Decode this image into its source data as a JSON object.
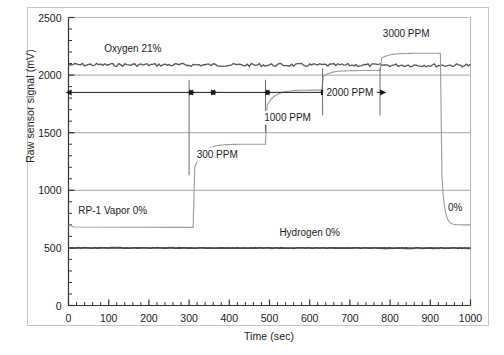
{
  "chart_data": {
    "type": "line",
    "title": "",
    "xlabel": "Time (sec)",
    "ylabel": "Raw sensor signal (mV)",
    "xlim": [
      0,
      1000
    ],
    "ylim": [
      0,
      2500
    ],
    "xticks": [
      0,
      100,
      200,
      300,
      400,
      500,
      600,
      700,
      800,
      900,
      1000
    ],
    "yticks": [
      0,
      500,
      1000,
      1500,
      2000,
      2500
    ],
    "x_minor_tick_step": 20,
    "y_minor_tick_step": 100,
    "grid": "horizontal-major",
    "legend": "none",
    "series": [
      {
        "name": "Oxygen 21%",
        "style": "noisy-flat",
        "color": "#555555",
        "points": [
          [
            0,
            2090
          ],
          [
            1000,
            2085
          ]
        ],
        "label": "Oxygen 21%",
        "label_x": 160,
        "label_y": 2200
      },
      {
        "name": "Hydrogen 0%",
        "style": "flat",
        "color": "#4a4a4a",
        "points": [
          [
            0,
            500
          ],
          [
            1000,
            498
          ]
        ],
        "label": "Hydrogen 0%",
        "label_x": 600,
        "label_y": 600
      },
      {
        "name": "RP-1 Vapor response",
        "style": "step-settling",
        "color": "#9a9a9a",
        "steps": [
          {
            "t_start": 0,
            "t_end": 310,
            "level": 700,
            "label": "RP-1 Vapor 0%"
          },
          {
            "t_start": 310,
            "t_end": 490,
            "level": 1400,
            "label": "300 PPM"
          },
          {
            "t_start": 490,
            "t_end": 630,
            "level": 1870,
            "label": "1000 PPM"
          },
          {
            "t_start": 630,
            "t_end": 775,
            "level": 2040,
            "label": "2000 PPM"
          },
          {
            "t_start": 775,
            "t_end": 925,
            "level": 2190,
            "label": "3000 PPM"
          },
          {
            "t_start": 925,
            "t_end": 1000,
            "level": 700,
            "label": "0%"
          }
        ]
      }
    ],
    "annotations": [
      {
        "text": "Oxygen 21%",
        "x": 160,
        "y": 2200
      },
      {
        "text": "RP-1 Vapor 0%",
        "x": 110,
        "y": 790
      },
      {
        "text": "300 PPM",
        "x": 370,
        "y": 1280
      },
      {
        "text": "1000 PPM",
        "x": 545,
        "y": 1600
      },
      {
        "text": "2000 PPM",
        "x": 700,
        "y": 1820
      },
      {
        "text": "3000 PPM",
        "x": 840,
        "y": 2330
      },
      {
        "text": "Hydrogen 0%",
        "x": 600,
        "y": 600
      },
      {
        "text": "0%",
        "x": 962,
        "y": 820
      }
    ],
    "interval_arrows": [
      {
        "t_start": 8,
        "t_end": 300,
        "y": 1850
      },
      {
        "t_start": 310,
        "t_end": 355,
        "y": 1850
      },
      {
        "t_start": 365,
        "t_end": 490,
        "y": 1850
      },
      {
        "t_start": 500,
        "t_end": 628,
        "y": 1850
      },
      {
        "t_start": 640,
        "t_end": 775,
        "y": 1850
      }
    ],
    "divider_lines": [
      {
        "t": 300,
        "y_top": 1960,
        "y_bottom": 1130
      },
      {
        "t": 490,
        "y_top": 1960,
        "y_bottom": 1500
      },
      {
        "t": 632,
        "y_top": 2060,
        "y_bottom": 1650
      },
      {
        "t": 775,
        "y_top": 2060,
        "y_bottom": 1650
      }
    ]
  },
  "axis": {
    "y_title": "Raw sensor signal (mV)",
    "x_title": "Time (sec)",
    "ytick_labels": [
      "0",
      "500",
      "1000",
      "1500",
      "2000",
      "2500"
    ],
    "xtick_labels": [
      "0",
      "100",
      "200",
      "300",
      "400",
      "500",
      "600",
      "700",
      "800",
      "900",
      "1000"
    ]
  },
  "colors": {
    "trace_gray": "#9a9a9a",
    "oxygen": "#555555",
    "hydrogen": "#4a4a4a",
    "grid": "#8a8a8a",
    "axis": "#333333",
    "frame": "#b8b8b8",
    "text": "#1a1a1a"
  }
}
